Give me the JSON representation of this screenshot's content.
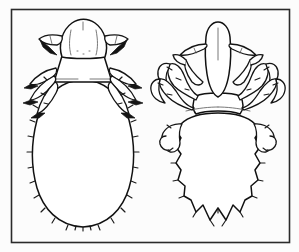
{
  "figure": {
    "kind": "scientific-line-drawing",
    "medium": "black ink line art on off-white ground",
    "title": "",
    "caption": "",
    "frame": {
      "present": true,
      "shape": "rectangle",
      "stroke_color": "#2b2b2b",
      "x": 11,
      "y": 9,
      "width": 279,
      "height": 234
    },
    "canvas": {
      "width": 299,
      "height": 252,
      "background_color": "#ffffff",
      "plate_background_color": "#fcfcfc",
      "ink_color": "#1a1a1a"
    },
    "subject_count": 2,
    "arrangement": "two specimens side by side, dorsal view, head uppermost"
  },
  "specimens": [
    {
      "id": "left-specimen",
      "position": "left",
      "common_name": "body louse",
      "view": "dorsal",
      "silhouette": "elongated smooth oval abdomen, broad rounded head, trapezoidal thorax",
      "bbox": {
        "x": 28,
        "y": 18,
        "width": 110,
        "height": 212
      },
      "parts": [
        {
          "name": "head",
          "description": "broad rounded dome, wider than long, faint median suture lines",
          "center_x": 83,
          "center_y": 38
        },
        {
          "name": "antenna-left",
          "description": "short segmented antenna projecting laterally from head with dark pointed tip beneath",
          "side": "left"
        },
        {
          "name": "antenna-right",
          "description": "short segmented antenna projecting laterally from head with dark pointed tip beneath",
          "side": "right"
        },
        {
          "name": "thorax",
          "description": "trapezoidal segment between head and abdomen bearing three leg pairs",
          "center_x": 83,
          "center_y": 66
        },
        {
          "name": "legs",
          "description": "three pairs of slender segmented legs with dark filled tarsal claws, directed laterally and backward",
          "pairs": 3
        },
        {
          "name": "abdomen",
          "description": "large smooth elongated oval, unsegmented outline, small setae spaced along both lateral margins, broadly rounded posterior",
          "center_x": 83,
          "center_y": 155
        },
        {
          "name": "setae",
          "description": "short bristles projecting outward along abdominal margins",
          "approximate_count": 20
        }
      ]
    },
    {
      "id": "right-specimen",
      "position": "right",
      "common_name": "crab louse",
      "view": "dorsal",
      "silhouette": "broad shield-like abdomen with scalloped lobed margins, narrow pointed head, massive hooked grasping claws",
      "bbox": {
        "x": 152,
        "y": 18,
        "width": 132,
        "height": 212
      },
      "parts": [
        {
          "name": "head",
          "description": "narrow elongated head tapering to a blunt point anteriorly, longer than wide",
          "center_x": 218,
          "center_y": 45
        },
        {
          "name": "antenna-left",
          "description": "slender antenna projecting outward and downward from head",
          "side": "left"
        },
        {
          "name": "antenna-right",
          "description": "slender antenna projecting outward and downward from head",
          "side": "right"
        },
        {
          "name": "thorax",
          "description": "short broad thorax fused with abdomen, bearing three pairs of robust legs",
          "center_x": 218,
          "center_y": 100
        },
        {
          "name": "legs-foreleg-pair",
          "description": "slender first leg pair with small claw, directed forward beside the head",
          "pairs": 1
        },
        {
          "name": "legs-grasping-pairs",
          "description": "two posterior pairs of stout legs with very large curved hooked claws for gripping hair shafts",
          "pairs": 2
        },
        {
          "name": "abdomen",
          "description": "broad shield-shaped abdomen, scalloped lateral lobes each bearing a bristle, tapering to a notched V-shaped posterior with pointed lobes",
          "center_x": 218,
          "center_y": 165
        },
        {
          "name": "setae",
          "description": "bristles at the apex of each lateral abdominal lobe",
          "approximate_count": 16
        }
      ]
    }
  ]
}
